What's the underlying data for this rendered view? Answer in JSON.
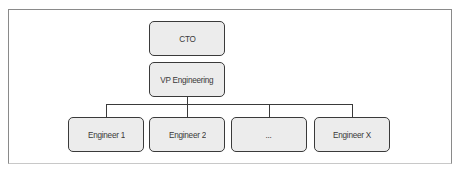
{
  "diagram": {
    "type": "org-chart",
    "nodes": {
      "cto": {
        "label": "CTO"
      },
      "vp": {
        "label": "VP Engineering"
      },
      "engineers": [
        {
          "label": "Engineer 1"
        },
        {
          "label": "Engineer 2"
        },
        {
          "label": "..."
        },
        {
          "label": "Engineer X"
        }
      ]
    },
    "edges": [
      {
        "from": "CTO",
        "to": "VP Engineering"
      },
      {
        "from": "VP Engineering",
        "to": "Engineer 1"
      },
      {
        "from": "VP Engineering",
        "to": "Engineer 2"
      },
      {
        "from": "VP Engineering",
        "to": "..."
      },
      {
        "from": "VP Engineering",
        "to": "Engineer X"
      }
    ],
    "colors": {
      "node_fill": "#ececec",
      "node_border": "#3a3a3a",
      "text": "#3a3a3a",
      "connector": "#3a3a3a",
      "frame": "#8a8a8a"
    }
  }
}
